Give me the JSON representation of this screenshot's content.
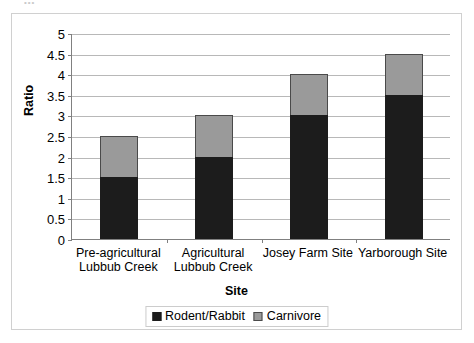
{
  "artifact": {
    "text": "•••"
  },
  "chart_data": {
    "type": "bar",
    "subtype": "stacked-bar",
    "title": "",
    "xlabel": "Site",
    "ylabel": "Ratio",
    "ylim": [
      0,
      5
    ],
    "ystep": 0.5,
    "grid": true,
    "legend_position": "bottom-center",
    "categories": [
      "Pre-agricultural\nLubbub Creek",
      "Agricultural\nLubbub Creek",
      "Josey Farm Site",
      "Yarborough Site"
    ],
    "ytick_labels": [
      "5",
      "4.5",
      "4",
      "3.5",
      "3",
      "2.5",
      "2",
      "1.5",
      "1",
      "0.5",
      "0"
    ],
    "ytick_values": [
      5,
      4.5,
      4,
      3.5,
      3,
      2.5,
      2,
      1.5,
      1,
      0.5,
      0
    ],
    "series": [
      {
        "name": "Rodent/Rabbit",
        "color": "#1c1c1c",
        "values": [
          1.5,
          2,
          3,
          3.5
        ]
      },
      {
        "name": "Carnivore",
        "color": "#9a9a9a",
        "values": [
          1,
          1,
          1,
          1
        ]
      }
    ],
    "totals": [
      2.5,
      3,
      4,
      4.5
    ]
  },
  "legend": {
    "items": [
      {
        "label": "Rodent/Rabbit",
        "swatch": "black-square-icon"
      },
      {
        "label": "Carnivore",
        "swatch": "gray-square-icon"
      }
    ]
  }
}
